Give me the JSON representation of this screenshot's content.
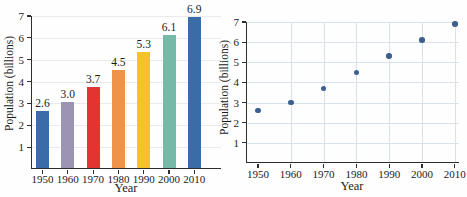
{
  "figure": {
    "background": "#fefefe",
    "text_color": "#1b1b1b",
    "axis_color": "#2e2e2e"
  },
  "chart_data": [
    {
      "type": "bar",
      "title": "",
      "xlabel": "Year",
      "ylabel": "Population (billions)",
      "categories": [
        "1950",
        "1960",
        "1970",
        "1980",
        "1990",
        "2000",
        "2010"
      ],
      "values": [
        2.6,
        3.0,
        3.7,
        4.5,
        5.3,
        6.1,
        6.9
      ],
      "data_labels": [
        "2.6",
        "3.0",
        "3.7",
        "4.5",
        "5.3",
        "6.1",
        "6.9"
      ],
      "bar_colors": [
        "#3a6da8",
        "#9c94b3",
        "#e43431",
        "#ef9349",
        "#f4c22d",
        "#75b9a7",
        "#3a6da8"
      ],
      "ylim": [
        0,
        7
      ],
      "yticks": [
        1,
        2,
        3,
        4,
        5,
        6,
        7
      ],
      "grid": "horizontal",
      "gridline_color": "#e7ebee"
    },
    {
      "type": "scatter",
      "title": "",
      "xlabel": "Year",
      "ylabel": "Population (billions)",
      "x": [
        1950,
        1960,
        1970,
        1980,
        1990,
        2000,
        2010
      ],
      "y": [
        2.6,
        3.0,
        3.7,
        4.5,
        5.3,
        6.1,
        6.9
      ],
      "xticks": [
        "1950",
        "1960",
        "1970",
        "1980",
        "1990",
        "2000",
        "2010"
      ],
      "yticks": [
        1,
        2,
        3,
        4,
        5,
        6,
        7
      ],
      "ylim": [
        0,
        7
      ],
      "point_color": "#3c5f90",
      "grid": "both",
      "gridline_color": "#d9e2ea"
    }
  ]
}
